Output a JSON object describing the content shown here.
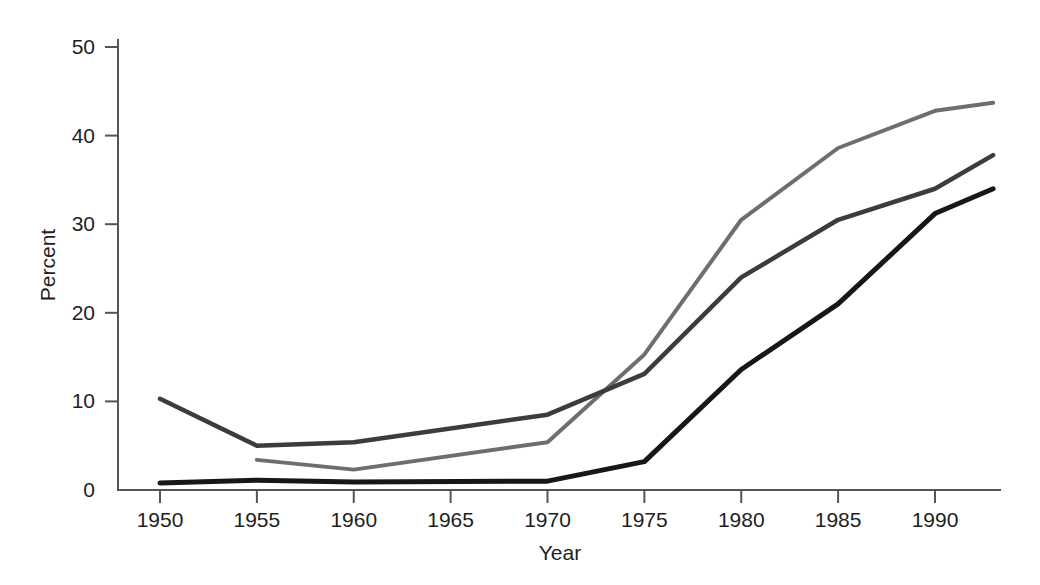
{
  "chart_data": {
    "type": "line",
    "title": "",
    "xlabel": "Year",
    "ylabel": "Percent",
    "xlim": [
      1948,
      1993
    ],
    "ylim": [
      0,
      52
    ],
    "grid": false,
    "legend": "none",
    "xticks": [
      1950,
      1955,
      1960,
      1965,
      1970,
      1975,
      1980,
      1985,
      1990
    ],
    "xtick_labels": [
      "1950",
      "1955",
      "1960",
      "1965",
      "1970",
      "1975",
      "1980",
      "1985",
      "1990"
    ],
    "yticks": [
      0,
      10,
      20,
      30,
      40,
      50
    ],
    "ytick_labels": [
      "0",
      "10",
      "20",
      "30",
      "40",
      "50"
    ],
    "series": [
      {
        "name": "series-light-gray",
        "color": "#6e6e6e",
        "stroke_width": 4,
        "x": [
          1955,
          1960,
          1970,
          1975,
          1980,
          1985,
          1990,
          1993
        ],
        "values": [
          3.4,
          2.3,
          5.4,
          15.3,
          30.5,
          38.6,
          42.8,
          43.7
        ]
      },
      {
        "name": "series-dark-gray",
        "color": "#3c3c3c",
        "stroke_width": 4.5,
        "x": [
          1950,
          1955,
          1960,
          1970,
          1975,
          1980,
          1985,
          1990,
          1993
        ],
        "values": [
          10.3,
          5.0,
          5.4,
          8.5,
          13.1,
          24.0,
          30.5,
          34.0,
          37.8
        ]
      },
      {
        "name": "series-black",
        "color": "#171717",
        "stroke_width": 5,
        "x": [
          1950,
          1955,
          1960,
          1970,
          1975,
          1980,
          1985,
          1990,
          1993
        ],
        "values": [
          0.8,
          1.1,
          0.9,
          1.0,
          3.2,
          13.6,
          21.0,
          31.2,
          34.0
        ]
      }
    ]
  },
  "axes": {
    "y_title": "Percent",
    "x_title": "Year"
  }
}
